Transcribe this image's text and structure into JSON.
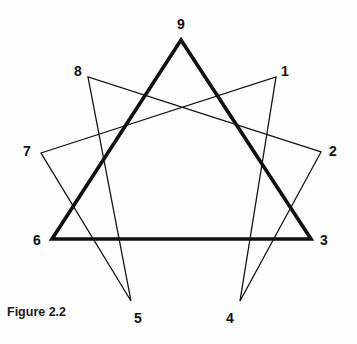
{
  "figure": {
    "caption": "Figure 2.2",
    "background_color": "#fdfdfd",
    "stroke_color": "#111111"
  },
  "diagram": {
    "type": "enneagram",
    "circle_visible": false,
    "triangle": {
      "name": "inner-triangle",
      "stroke_width": 3.6,
      "points": [
        "9",
        "3",
        "6"
      ]
    },
    "hexad": {
      "name": "hexad-path",
      "stroke_width": 1.3,
      "sequence": [
        "1",
        "4",
        "2",
        "8",
        "5",
        "7"
      ]
    },
    "nodes": [
      {
        "id": "9",
        "label": "9",
        "x": 181,
        "y": 40,
        "label_x": 177,
        "label_y": 17
      },
      {
        "id": "1",
        "label": "1",
        "x": 276,
        "y": 77,
        "label_x": 281,
        "label_y": 64
      },
      {
        "id": "2",
        "label": "2",
        "x": 321,
        "y": 152,
        "label_x": 329,
        "label_y": 144
      },
      {
        "id": "3",
        "label": "3",
        "x": 311,
        "y": 239,
        "label_x": 320,
        "label_y": 233
      },
      {
        "id": "4",
        "label": "4",
        "x": 240,
        "y": 301,
        "label_x": 226,
        "label_y": 311
      },
      {
        "id": "5",
        "label": "5",
        "x": 131,
        "y": 301,
        "label_x": 134,
        "label_y": 311
      },
      {
        "id": "6",
        "label": "6",
        "x": 52,
        "y": 239,
        "label_x": 33,
        "label_y": 233
      },
      {
        "id": "7",
        "label": "7",
        "x": 41,
        "y": 153,
        "label_x": 23,
        "label_y": 144
      },
      {
        "id": "8",
        "label": "8",
        "x": 88,
        "y": 77,
        "label_x": 74,
        "label_y": 64
      }
    ]
  }
}
